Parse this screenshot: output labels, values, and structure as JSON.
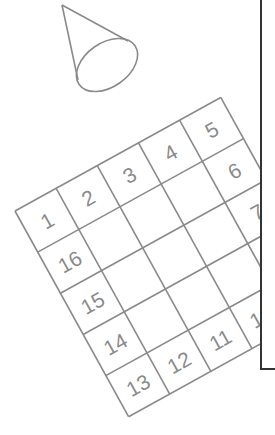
{
  "diagram": {
    "colors": {
      "line": "#8a8a8a",
      "text": "#8a8a8a",
      "frame": "#333333",
      "background": "#ffffff"
    },
    "grid": {
      "rows": 5,
      "cols": 5,
      "rotation_deg": -28.9,
      "origin": [
        15,
        211
      ],
      "cell_size": 47,
      "labels": [
        {
          "text": "1",
          "row": 0,
          "col": 0
        },
        {
          "text": "2",
          "row": 0,
          "col": 1
        },
        {
          "text": "3",
          "row": 0,
          "col": 2
        },
        {
          "text": "4",
          "row": 0,
          "col": 3
        },
        {
          "text": "5",
          "row": 0,
          "col": 4
        },
        {
          "text": "6",
          "row": 1,
          "col": 4
        },
        {
          "text": "7",
          "row": 2,
          "col": 4
        },
        {
          "text": "8",
          "row": 3,
          "col": 4
        },
        {
          "text": "9",
          "row": 4,
          "col": 4
        },
        {
          "text": "10",
          "row": 4,
          "col": 3
        },
        {
          "text": "11",
          "row": 4,
          "col": 2
        },
        {
          "text": "12",
          "row": 4,
          "col": 1
        },
        {
          "text": "13",
          "row": 4,
          "col": 0
        },
        {
          "text": "14",
          "row": 3,
          "col": 0
        },
        {
          "text": "15",
          "row": 2,
          "col": 0
        },
        {
          "text": "16",
          "row": 1,
          "col": 0
        }
      ]
    },
    "cone": {
      "apex": [
        62,
        5
      ],
      "base_center": [
        107,
        65
      ],
      "base_rx": 34,
      "base_ry": 22,
      "base_rotation_deg": -35
    },
    "panel": {
      "left_x": 261,
      "bottom_y": 369
    }
  }
}
